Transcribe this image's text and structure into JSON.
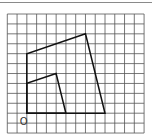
{
  "diagram": {
    "grid": {
      "left": 7.3,
      "top": 14,
      "cols": 14,
      "rows": 12,
      "cell_w": 9.77,
      "cell_h": 9.92,
      "line_color": "#555555"
    },
    "origin": {
      "label": "O",
      "col": 2,
      "row": 10
    },
    "shapes": [
      {
        "name": "outer-quadrilateral",
        "points_grid": [
          [
            0,
            0
          ],
          [
            0,
            6
          ],
          [
            6,
            8
          ],
          [
            8,
            0
          ]
        ],
        "stroke": "#111111"
      },
      {
        "name": "inner-quadrilateral",
        "points_grid": [
          [
            0,
            0
          ],
          [
            0,
            3
          ],
          [
            3,
            4
          ],
          [
            4,
            0
          ]
        ],
        "stroke": "#111111"
      }
    ]
  }
}
